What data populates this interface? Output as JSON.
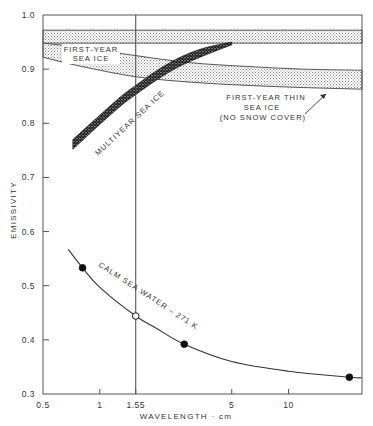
{
  "chart_data": {
    "type": "line",
    "title": "",
    "xlabel": "WAVELENGTH · cm",
    "ylabel": "EMISSIVITY",
    "xscale": "log",
    "xlim": [
      0.5,
      24.5
    ],
    "ylim": [
      0.3,
      1.0
    ],
    "grid": false,
    "x_ticks": [
      {
        "value": 0.5,
        "label": "0.5"
      },
      {
        "value": 1,
        "label": "1"
      },
      {
        "value": 1.55,
        "label": "1.55"
      },
      {
        "value": 5,
        "label": "5"
      },
      {
        "value": 10,
        "label": "10"
      }
    ],
    "y_ticks": [
      {
        "value": 1.0,
        "label": "1.0"
      },
      {
        "value": 0.9,
        "label": "0.9"
      },
      {
        "value": 0.8,
        "label": "0.8"
      },
      {
        "value": 0.7,
        "label": "0.7"
      },
      {
        "value": 0.6,
        "label": "0.6"
      },
      {
        "value": 0.5,
        "label": "0.5"
      },
      {
        "value": 0.4,
        "label": "0.4"
      },
      {
        "value": 0.3,
        "label": "0.3"
      }
    ],
    "reference_line": {
      "x": 1.55,
      "label": "1.55"
    },
    "series": [
      {
        "name": "First-year thick sea ice (upper band)",
        "kind": "band",
        "fill": "stipple-light",
        "x": [
          0.5,
          24.5
        ],
        "upper": [
          0.972,
          0.972
        ],
        "lower": [
          0.948,
          0.948
        ]
      },
      {
        "name": "FIRST-YEAR SEA ICE",
        "kind": "band",
        "fill": "stipple-light",
        "x": [
          0.5,
          0.8,
          1.55,
          3,
          6,
          12,
          24.5
        ],
        "upper": [
          0.948,
          0.94,
          0.925,
          0.912,
          0.905,
          0.9,
          0.898
        ],
        "lower": [
          0.922,
          0.905,
          0.886,
          0.876,
          0.87,
          0.866,
          0.863
        ]
      },
      {
        "name": "MULTIYEAR SEA ICE",
        "kind": "band",
        "fill": "crosshatch-dark",
        "x": [
          0.72,
          1.0,
          1.3,
          1.55,
          2.0,
          2.6,
          3.5,
          5.0
        ],
        "upper": [
          0.77,
          0.815,
          0.85,
          0.87,
          0.897,
          0.92,
          0.938,
          0.95
        ],
        "lower": [
          0.752,
          0.798,
          0.833,
          0.853,
          0.88,
          0.904,
          0.924,
          0.945
        ]
      },
      {
        "name": "CALM SEA WATER - 271 K",
        "kind": "line",
        "x": [
          0.68,
          0.81,
          1.0,
          1.55,
          2.0,
          2.8,
          5.0,
          10.0,
          21.0,
          24.5
        ],
        "y": [
          0.567,
          0.533,
          0.497,
          0.444,
          0.421,
          0.392,
          0.36,
          0.342,
          0.331,
          0.33
        ]
      }
    ],
    "points": [
      {
        "x": 0.81,
        "y": 0.533,
        "marker": "filled"
      },
      {
        "x": 1.55,
        "y": 0.444,
        "marker": "open"
      },
      {
        "x": 2.8,
        "y": 0.392,
        "marker": "filled"
      },
      {
        "x": 21.0,
        "y": 0.331,
        "marker": "filled"
      }
    ],
    "annotations": [
      {
        "id": "fy",
        "lines": [
          "FIRST-YEAR",
          "SEA ICE"
        ],
        "x": 82,
        "y": 53
      },
      {
        "id": "fythin",
        "lines": [
          "FIRST-YEAR THIN",
          "SEA ICE",
          "(NO SNOW COVER)"
        ],
        "x": 265,
        "y": 98
      },
      {
        "id": "my",
        "lines": [
          "MULTIYEAR SEA ICE"
        ]
      },
      {
        "id": "calm",
        "lines": [
          "CALM SEA WATER – 271 K"
        ]
      }
    ]
  },
  "labels": {
    "xlabel": "WAVELENGTH · cm",
    "ylabel": "EMISSIVITY",
    "first_year_1": "FIRST-YEAR",
    "first_year_2": "SEA ICE",
    "thin_1": "FIRST-YEAR THIN",
    "thin_2": "SEA ICE",
    "thin_3": "(NO SNOW COVER)",
    "multiyear": "MULTIYEAR SEA ICE",
    "calm": "CALM SEA WATER – 271 K"
  },
  "colors": {
    "ink": "#333333",
    "stipple": "#9a9a9a",
    "hatch_dark": "#222222",
    "background": "#ffffff"
  }
}
